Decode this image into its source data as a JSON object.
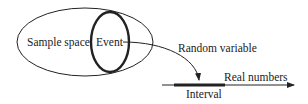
{
  "diagram": {
    "labels": {
      "sample_space": "Sample space",
      "event": "Event",
      "random_variable": "Random variable",
      "real_numbers": "Real numbers",
      "interval": "Interval"
    },
    "colors": {
      "stroke": "#222222",
      "background": "#ffffff"
    }
  }
}
